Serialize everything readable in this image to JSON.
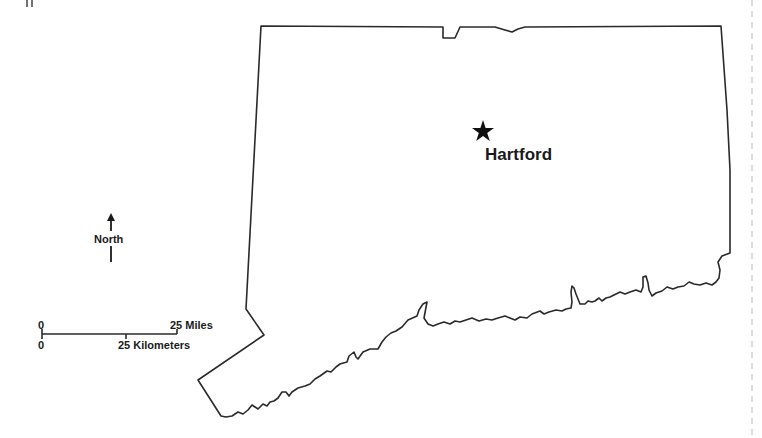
{
  "map": {
    "region": "Connecticut",
    "background_color": "#ffffff",
    "outline_color": "#2a2a2a",
    "capital": {
      "name": "Hartford",
      "marker": "star-icon"
    },
    "north_arrow": {
      "label": "North"
    },
    "scale_bar": {
      "miles": {
        "start_label": "0",
        "end_label": "25 Miles"
      },
      "kilometers": {
        "start_label": "0",
        "end_label": "25 Kilometers"
      }
    },
    "corner_fragment": "ıı"
  }
}
